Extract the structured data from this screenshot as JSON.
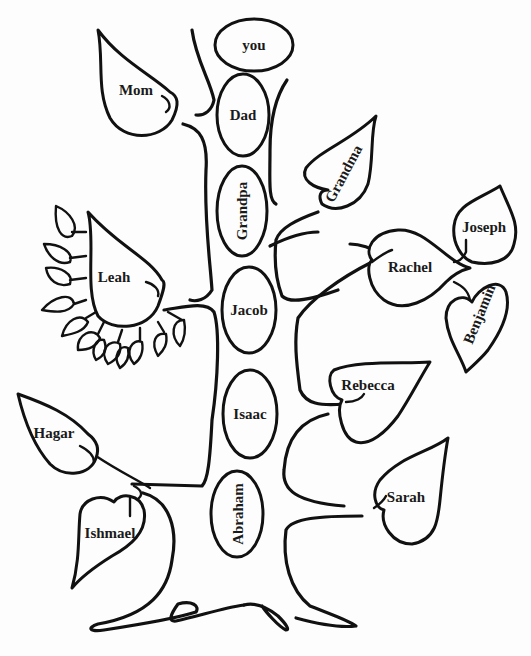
{
  "diagram": {
    "type": "family-tree",
    "trunk_ovals": [
      {
        "id": "you",
        "label": "you"
      },
      {
        "id": "dad",
        "label": "Dad"
      },
      {
        "id": "grandpa",
        "label": "Grandpa"
      },
      {
        "id": "jacob",
        "label": "Jacob"
      },
      {
        "id": "isaac",
        "label": "Isaac"
      },
      {
        "id": "abraham",
        "label": "Abraham"
      }
    ],
    "leaves": [
      {
        "id": "mom",
        "label": "Mom"
      },
      {
        "id": "grandma",
        "label": "Grandma"
      },
      {
        "id": "leah",
        "label": "Leah"
      },
      {
        "id": "rachel",
        "label": "Rachel"
      },
      {
        "id": "joseph",
        "label": "Joseph"
      },
      {
        "id": "benjamin",
        "label": "Benjamin"
      },
      {
        "id": "rebecca",
        "label": "Rebecca"
      },
      {
        "id": "hagar",
        "label": "Hagar"
      },
      {
        "id": "ishmael",
        "label": "Ishmael"
      },
      {
        "id": "sarah",
        "label": "Sarah"
      }
    ],
    "leah_small_leaves_count": 12,
    "ink_color": "#111111",
    "background_color": "#fdfdfd"
  }
}
